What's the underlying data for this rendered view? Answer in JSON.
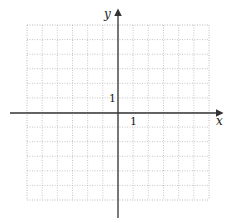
{
  "diagram": {
    "type": "coordinate-grid",
    "grid": {
      "x_min": 27,
      "x_max": 209,
      "y_min": 25,
      "y_max": 200,
      "cols": 12,
      "rows": 12,
      "line_color": "#b8b8b8",
      "border_color": "#a8a8a8"
    },
    "axes": {
      "origin_px": [
        118,
        113
      ],
      "color": "#333333",
      "x_axis": {
        "from": 10,
        "to": 222,
        "label": "x"
      },
      "y_axis": {
        "from": 218,
        "to": 10,
        "label": "y"
      }
    },
    "tick_labels": {
      "x_one": "1",
      "y_one": "1"
    }
  }
}
